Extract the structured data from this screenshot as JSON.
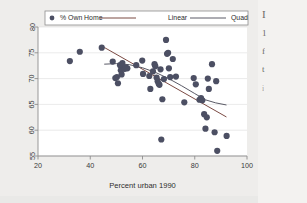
{
  "figure": {
    "background_color": "#eeedeb",
    "plot_background_color": "#ffffff",
    "frame_color": "#8d8d8d"
  },
  "page_text": {
    "lines": [
      "I",
      "1",
      "f",
      "t",
      "i"
    ]
  },
  "chart_data": {
    "type": "scatter",
    "title": "",
    "subtitle": "",
    "xlabel": "Percent urban 1990",
    "ylabel": "",
    "xlim": [
      20,
      100
    ],
    "ylim": [
      55,
      80
    ],
    "xticks": [
      20,
      40,
      60,
      80,
      100
    ],
    "yticks": [
      55,
      60,
      65,
      70,
      75,
      80
    ],
    "xticklabels": [
      "20",
      "40",
      "60",
      "80",
      "100"
    ],
    "yticklabels": [
      "55",
      "60",
      "65",
      "70",
      "75",
      "80"
    ],
    "grid": "horizontal",
    "legend_position": "top-center",
    "legend": [
      {
        "label": "% Own Home",
        "kind": "marker",
        "color": "#4c4f63"
      },
      {
        "label": "Linear",
        "kind": "line",
        "color": "#7b4a43"
      },
      {
        "label": "Quad",
        "kind": "line",
        "color": "#5a5a66"
      }
    ],
    "series": [
      {
        "name": "% Own Home",
        "kind": "scatter",
        "marker_color": "#4c4f63",
        "marker_size": 3.1,
        "points": [
          [
            32.2,
            73.4
          ],
          [
            36.0,
            75.2
          ],
          [
            44.4,
            76.0
          ],
          [
            48.6,
            73.3
          ],
          [
            49.6,
            70.1
          ],
          [
            50.2,
            70.3
          ],
          [
            50.6,
            69.1
          ],
          [
            51.4,
            72.6
          ],
          [
            51.7,
            71.6
          ],
          [
            52.0,
            70.8
          ],
          [
            52.3,
            73.0
          ],
          [
            52.9,
            72.0
          ],
          [
            53.2,
            71.9
          ],
          [
            53.6,
            72.2
          ],
          [
            54.2,
            72.0
          ],
          [
            57.6,
            72.6
          ],
          [
            59.9,
            73.5
          ],
          [
            60.2,
            70.9
          ],
          [
            62.6,
            70.5
          ],
          [
            63.0,
            68.0
          ],
          [
            64.0,
            71.4
          ],
          [
            64.6,
            72.8
          ],
          [
            64.9,
            72.4
          ],
          [
            65.4,
            70.2
          ],
          [
            65.8,
            69.5
          ],
          [
            66.2,
            69.0
          ],
          [
            66.5,
            68.8
          ],
          [
            66.9,
            71.8
          ],
          [
            67.2,
            58.2
          ],
          [
            67.6,
            66.0
          ],
          [
            68.2,
            69.9
          ],
          [
            69.0,
            77.5
          ],
          [
            69.4,
            74.8
          ],
          [
            69.8,
            75.0
          ],
          [
            70.1,
            72.0
          ],
          [
            70.6,
            70.3
          ],
          [
            71.6,
            73.8
          ],
          [
            72.8,
            70.4
          ],
          [
            76.0,
            65.4
          ],
          [
            79.6,
            70.1
          ],
          [
            80.4,
            68.9
          ],
          [
            81.8,
            65.9
          ],
          [
            82.4,
            66.2
          ],
          [
            82.9,
            65.8
          ],
          [
            83.6,
            63.1
          ],
          [
            84.1,
            60.3
          ],
          [
            84.6,
            62.5
          ],
          [
            85.0,
            70.0
          ],
          [
            85.4,
            68.0
          ],
          [
            86.6,
            72.8
          ],
          [
            87.6,
            59.6
          ],
          [
            88.2,
            69.5
          ],
          [
            88.6,
            56.0
          ],
          [
            92.2,
            58.9
          ]
        ]
      },
      {
        "name": "Linear",
        "kind": "line",
        "color": "#7b4a43",
        "points": [
          [
            45.5,
            76.0
          ],
          [
            92.0,
            62.6
          ]
        ]
      },
      {
        "name": "Quad",
        "kind": "line",
        "color": "#5a5a66",
        "points": [
          [
            45.5,
            72.8
          ],
          [
            50.0,
            72.9
          ],
          [
            55.0,
            72.7
          ],
          [
            60.0,
            72.1
          ],
          [
            65.0,
            71.2
          ],
          [
            70.0,
            70.0
          ],
          [
            75.0,
            68.6
          ],
          [
            80.0,
            67.1
          ],
          [
            84.0,
            65.9
          ],
          [
            88.0,
            65.3
          ],
          [
            92.0,
            64.9
          ]
        ]
      }
    ]
  }
}
